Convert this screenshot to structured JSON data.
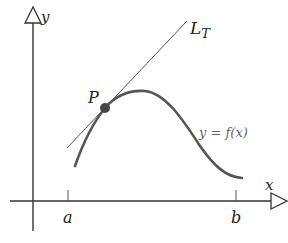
{
  "figure": {
    "type": "tangent-line-diagram",
    "axes": {
      "x_label": "x",
      "y_label": "y"
    },
    "ticks": {
      "a_label": "a",
      "b_label": "b"
    },
    "point": {
      "label": "P"
    },
    "tangent": {
      "label_main": "L",
      "label_sub": "T"
    },
    "curve": {
      "label": "y = f(x)"
    },
    "colors": {
      "axis": "#333333",
      "curve": "#555555",
      "tangent": "#555555",
      "point": "#444444",
      "curve_label": "#666666"
    }
  }
}
